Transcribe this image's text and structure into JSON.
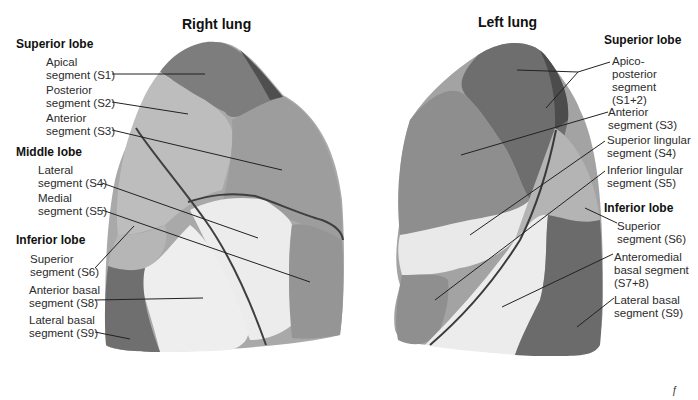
{
  "titles": {
    "right": "Right lung",
    "left": "Left lung"
  },
  "right_lung": {
    "lobes": [
      {
        "name": "Superior lobe",
        "segments": [
          {
            "line1": "Apical",
            "line2": "segment (S1)"
          },
          {
            "line1": "Posterior",
            "line2": "segment (S2)"
          },
          {
            "line1": "Anterior",
            "line2": "segment (S3)"
          }
        ]
      },
      {
        "name": "Middle lobe",
        "segments": [
          {
            "line1": "Lateral",
            "line2": "segment (S4)"
          },
          {
            "line1": "Medial",
            "line2": "segment (S5)"
          }
        ]
      },
      {
        "name": "Inferior lobe",
        "segments": [
          {
            "line1": "Superior",
            "line2": "segment (S6)"
          },
          {
            "line1": "Anterior basal",
            "line2": "segment (S8)"
          },
          {
            "line1": "Lateral basal",
            "line2": "segment (S9)"
          }
        ]
      }
    ]
  },
  "left_lung": {
    "lobes": [
      {
        "name": "Superior lobe",
        "segments": [
          {
            "line1": "Apico-",
            "line2": "posterior",
            "line3": "segment",
            "line4": "(S1+2)"
          },
          {
            "line1": "Anterior",
            "line2": "segment (S3)"
          },
          {
            "line1": "Superior lingular",
            "line2": "segment (S4)"
          },
          {
            "line1": "Inferior lingular",
            "line2": "segment (S5)"
          }
        ]
      },
      {
        "name": "Inferior lobe",
        "segments": [
          {
            "line1": "Superior",
            "line2": "segment (S6)"
          },
          {
            "line1": "Anteromedial",
            "line2": "basal segment",
            "line3": "(S7+8)"
          },
          {
            "line1": "Lateral basal",
            "line2": "segment (S9)"
          }
        ]
      }
    ]
  },
  "signature": "ƒ",
  "colors": {
    "background": "#ffffff",
    "apical_dark": "#6e6e6e",
    "posterior_light": "#b4b4b4",
    "anterior_mid": "#9a9a9a",
    "middle_pale": "#e6e6e6",
    "inferior_dark": "#6a6a6a",
    "inferior_mid": "#8c8c8c",
    "fissure": "#3a3a3a",
    "leader_line": "#222222"
  }
}
